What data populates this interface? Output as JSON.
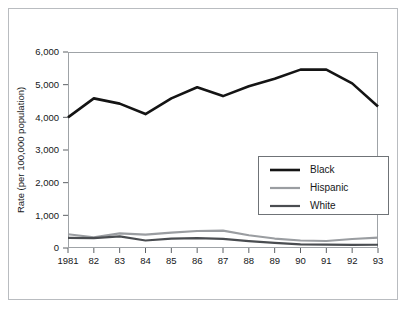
{
  "chart_data": {
    "type": "line",
    "title": "",
    "xlabel": "",
    "ylabel": "Rate (per 100,000 population)",
    "ylim": [
      0,
      6000
    ],
    "ytick_values": [
      0,
      1000,
      2000,
      3000,
      4000,
      5000,
      6000
    ],
    "ytick_labels": [
      "0",
      "1,000",
      "2,000",
      "3,000",
      "4,000",
      "5,000",
      "6,000"
    ],
    "categories": [
      "1981",
      "82",
      "83",
      "84",
      "85",
      "86",
      "87",
      "88",
      "89",
      "90",
      "91",
      "92",
      "93"
    ],
    "grid": false,
    "legend_position": "inside-lower-right",
    "series": [
      {
        "name": "Black",
        "color": "#141414",
        "width": 2.6,
        "values": [
          4000,
          4580,
          4420,
          4100,
          4580,
          4920,
          4650,
          4950,
          5180,
          5460,
          5460,
          5040,
          4330
        ]
      },
      {
        "name": "Hispanic",
        "color": "#9a9da1",
        "width": 2.2,
        "values": [
          420,
          330,
          450,
          410,
          470,
          520,
          530,
          390,
          290,
          230,
          215,
          275,
          320
        ]
      },
      {
        "name": "White",
        "color": "#4a4d51",
        "width": 2.2,
        "values": [
          310,
          300,
          355,
          230,
          290,
          300,
          280,
          210,
          155,
          110,
          105,
          95,
          100
        ]
      }
    ]
  },
  "legend": {
    "items": [
      {
        "label": "Black"
      },
      {
        "label": "Hispanic"
      },
      {
        "label": "White"
      }
    ]
  },
  "colors": {
    "black_series": "#141414",
    "hispanic_series": "#9a9da1",
    "white_series": "#4a4d51",
    "axis": "#5d6165",
    "frame": "#b9bcc0",
    "text": "#161719"
  }
}
